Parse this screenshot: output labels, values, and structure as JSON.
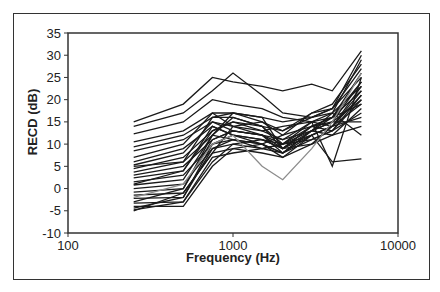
{
  "chart_data": {
    "type": "line",
    "title": "",
    "xlabel": "Frequency (Hz)",
    "ylabel": "RECD (dB)",
    "xscale": "log",
    "xlim": [
      100,
      10000
    ],
    "ylim": [
      -10,
      35
    ],
    "x_ticks": [
      "100",
      "1000",
      "10000"
    ],
    "y_ticks": [
      "35",
      "30",
      "25",
      "20",
      "15",
      "10",
      "5",
      "0",
      "-5",
      "-10"
    ],
    "grid": false,
    "legend": null,
    "x": [
      250,
      500,
      750,
      1000,
      1500,
      2000,
      3000,
      4000,
      6000
    ],
    "series": [
      {
        "name": "S1",
        "values": [
          15,
          19,
          25,
          24,
          23,
          22,
          23.5,
          22,
          31
        ]
      },
      {
        "name": "S2",
        "values": [
          14,
          17,
          22,
          26,
          21,
          17,
          16,
          18,
          30
        ]
      },
      {
        "name": "S3",
        "values": [
          12.3,
          15,
          20,
          19,
          18,
          16,
          15,
          17,
          29
        ]
      },
      {
        "name": "S4",
        "values": [
          10.5,
          13,
          17,
          17,
          15,
          12,
          17,
          19,
          28
        ]
      },
      {
        "name": "S5",
        "values": [
          9.4,
          12,
          16,
          16,
          14,
          13,
          16,
          18,
          27
        ]
      },
      {
        "name": "S6",
        "values": [
          8.5,
          11,
          15,
          14,
          12,
          10,
          14,
          16,
          26
        ]
      },
      {
        "name": "S7",
        "values": [
          7,
          10,
          17,
          14,
          13,
          11,
          15,
          5,
          25
        ]
      },
      {
        "name": "S8",
        "values": [
          6,
          9,
          14,
          12,
          11,
          9,
          13,
          15,
          24
        ]
      },
      {
        "name": "S9",
        "values": [
          5.3,
          8,
          15,
          13,
          12,
          8,
          12,
          14,
          23
        ]
      },
      {
        "name": "S10",
        "values": [
          4.5,
          7,
          13,
          15,
          14,
          10,
          13,
          16,
          22
        ]
      },
      {
        "name": "S11",
        "values": [
          3.7,
          6,
          12,
          11,
          10,
          8,
          11,
          13,
          21
        ]
      },
      {
        "name": "S12",
        "values": [
          3,
          5,
          11,
          13,
          12,
          9,
          14,
          15,
          20
        ]
      },
      {
        "name": "S13",
        "values": [
          2.4,
          4,
          14,
          12,
          10,
          7,
          12,
          14,
          19
        ]
      },
      {
        "name": "S14",
        "values": [
          1.5,
          3,
          10,
          11,
          9,
          8,
          13,
          12,
          18
        ]
      },
      {
        "name": "S15",
        "values": [
          0.8,
          2,
          12,
          16,
          14,
          9,
          14,
          13,
          17
        ]
      },
      {
        "name": "S16",
        "values": [
          0,
          1,
          9,
          10,
          11,
          10,
          15,
          14,
          16
        ]
      },
      {
        "name": "S17",
        "values": [
          -0.8,
          0,
          11,
          13,
          12,
          11,
          13,
          15,
          15
        ]
      },
      {
        "name": "S18",
        "values": [
          -1.5,
          -1,
          8,
          9,
          10,
          12,
          14,
          16,
          24
        ]
      },
      {
        "name": "S19",
        "values": [
          -2.2,
          -2,
          10,
          12,
          11,
          9,
          12,
          14,
          22
        ]
      },
      {
        "name": "S20",
        "values": [
          -3.3,
          -3,
          7,
          8,
          9,
          10,
          11,
          13,
          20
        ]
      },
      {
        "name": "S21",
        "values": [
          -4,
          -4,
          5,
          9,
          8,
          7,
          10,
          12,
          14
        ]
      },
      {
        "name": "S22",
        "values": [
          -4.4,
          -2,
          9,
          11,
          10,
          8,
          13,
          17,
          12
        ]
      },
      {
        "name": "S23",
        "values": [
          -4.8,
          -3,
          6,
          10,
          9,
          10,
          12,
          6,
          6.7
        ]
      },
      {
        "name": "S24",
        "values": [
          -5,
          -1,
          8,
          14,
          15,
          13,
          17,
          18,
          25
        ]
      },
      {
        "name": "S25",
        "values": [
          -3,
          0,
          12,
          17,
          16,
          15,
          16,
          17,
          23
        ]
      },
      {
        "name": "S26",
        "values": [
          1,
          4,
          13,
          15,
          13,
          14,
          15,
          16,
          19
        ]
      },
      {
        "name": "S27",
        "values": [
          5,
          6,
          16,
          17,
          16,
          9,
          10,
          14,
          21
        ]
      },
      {
        "name": "S28",
        "values": [
          -2,
          1,
          10,
          12,
          5,
          2,
          9,
          15,
          26
        ]
      }
    ],
    "series_colors": {
      "default": "#1a1a1a",
      "S28": "#8c8c8c"
    }
  }
}
